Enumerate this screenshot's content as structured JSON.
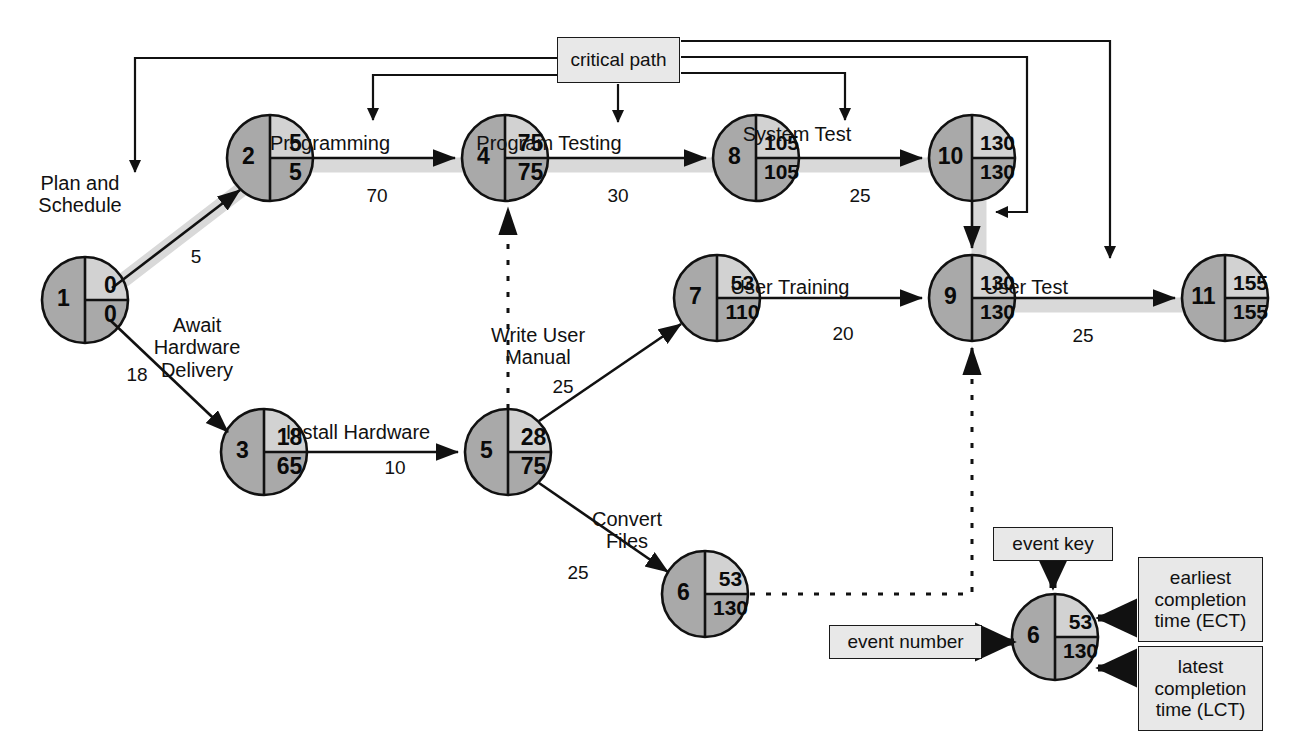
{
  "diagram": {
    "type": "pert-cpm-network",
    "colors": {
      "node_left": "#a9a9a9",
      "node_top_right": "#d2d2d2",
      "node_bottom_right": "#a9a9a9",
      "node_stroke": "#111111",
      "critical_path_highlight": "#d9d9d9",
      "box_fill": "#e8e8e8",
      "line": "#111111"
    },
    "critical_path_label": "critical path"
  },
  "nodes": [
    {
      "id": "n1",
      "number": "1",
      "ect": "0",
      "lct": "0",
      "cx": 85,
      "cy": 300,
      "r": 43
    },
    {
      "id": "n2",
      "number": "2",
      "ect": "5",
      "lct": "5",
      "cx": 270,
      "cy": 158,
      "r": 43
    },
    {
      "id": "n3",
      "number": "3",
      "ect": "18",
      "lct": "65",
      "cx": 264,
      "cy": 452,
      "r": 43
    },
    {
      "id": "n4",
      "number": "4",
      "ect": "75",
      "lct": "75",
      "cx": 505,
      "cy": 158,
      "r": 43
    },
    {
      "id": "n5",
      "number": "5",
      "ect": "28",
      "lct": "75",
      "cx": 508,
      "cy": 452,
      "r": 43
    },
    {
      "id": "n6",
      "number": "6",
      "ect": "53",
      "lct": "130",
      "cx": 705,
      "cy": 594,
      "r": 43
    },
    {
      "id": "n7",
      "number": "7",
      "ect": "53",
      "lct": "110",
      "cx": 717,
      "cy": 298,
      "r": 43
    },
    {
      "id": "n8",
      "number": "8",
      "ect": "105",
      "lct": "105",
      "cx": 756,
      "cy": 158,
      "r": 43
    },
    {
      "id": "n9",
      "number": "9",
      "ect": "130",
      "lct": "130",
      "cx": 972,
      "cy": 298,
      "r": 43
    },
    {
      "id": "n10",
      "number": "10",
      "ect": "130",
      "lct": "130",
      "cx": 972,
      "cy": 158,
      "r": 43
    },
    {
      "id": "n11",
      "number": "11",
      "ect": "155",
      "lct": "155",
      "cx": 1225,
      "cy": 298,
      "r": 43
    }
  ],
  "activities": [
    {
      "id": "a1",
      "name": "Plan and\nSchedule",
      "duration": "5",
      "from": "1",
      "to": "2",
      "critical": true,
      "name_x": 80,
      "name_y": 172,
      "dur_x": 196,
      "dur_y": 246
    },
    {
      "id": "a2",
      "name": "Await\nHardware\nDelivery",
      "duration": "18",
      "from": "1",
      "to": "3",
      "critical": false,
      "name_x": 197,
      "name_y": 314,
      "dur_x": 137,
      "dur_y": 364
    },
    {
      "id": "a3",
      "name": "Programming",
      "duration": "70",
      "from": "2",
      "to": "4",
      "critical": true,
      "name_x": 330,
      "name_y": 132,
      "dur_x": 377,
      "dur_y": 185
    },
    {
      "id": "a4",
      "name": "Program Testing",
      "duration": "30",
      "from": "4",
      "to": "8",
      "critical": true,
      "name_x": 549,
      "name_y": 132,
      "dur_x": 618,
      "dur_y": 185
    },
    {
      "id": "a5",
      "name": "System Test",
      "duration": "25",
      "from": "8",
      "to": "10",
      "critical": true,
      "name_x": 797,
      "name_y": 123,
      "dur_x": 860,
      "dur_y": 185
    },
    {
      "id": "a6",
      "name": "Install Hardware",
      "duration": "10",
      "from": "3",
      "to": "5",
      "critical": false,
      "name_x": 358,
      "name_y": 421,
      "dur_x": 395,
      "dur_y": 457
    },
    {
      "id": "a7",
      "name": "Write User\nManual",
      "duration": "25",
      "from": "5",
      "to": "7",
      "critical": false,
      "name_x": 538,
      "name_y": 324,
      "dur_x": 563,
      "dur_y": 376
    },
    {
      "id": "a8",
      "name": "Convert\nFiles",
      "duration": "25",
      "from": "5",
      "to": "6",
      "critical": false,
      "name_x": 627,
      "name_y": 508,
      "dur_x": 578,
      "dur_y": 562
    },
    {
      "id": "a9",
      "name": "User Training",
      "duration": "20",
      "from": "7",
      "to": "9",
      "critical": false,
      "name_x": 790,
      "name_y": 276,
      "dur_x": 843,
      "dur_y": 323
    },
    {
      "id": "a10",
      "name": "User Test",
      "duration": "25",
      "from": "9",
      "to": "11",
      "critical": true,
      "name_x": 1026,
      "name_y": 276,
      "dur_x": 1083,
      "dur_y": 325
    }
  ],
  "dummy_activities": [
    {
      "id": "d1",
      "from": "5",
      "to": "4",
      "style": "dashed"
    },
    {
      "id": "d2",
      "from": "6",
      "to": "9",
      "style": "dashed"
    }
  ],
  "critical_path_box": {
    "label": "critical path",
    "x": 557,
    "y": 37,
    "w": 123,
    "h": 46
  },
  "legend": {
    "event_key": {
      "label": "event key",
      "x": 993,
      "y": 527,
      "w": 120,
      "h": 34
    },
    "event_number": {
      "label": "event number",
      "x": 829,
      "y": 625,
      "w": 153,
      "h": 34
    },
    "ect": {
      "label": "earliest\ncompletion\ntime (ECT)",
      "x": 1138,
      "y": 557,
      "w": 125,
      "h": 85
    },
    "lct": {
      "label": "latest\ncompletion\ntime (LCT)",
      "x": 1138,
      "y": 646,
      "w": 125,
      "h": 85
    },
    "node": {
      "number": "6",
      "ect": "53",
      "lct": "130",
      "cx": 1055,
      "cy": 637,
      "r": 43
    }
  }
}
